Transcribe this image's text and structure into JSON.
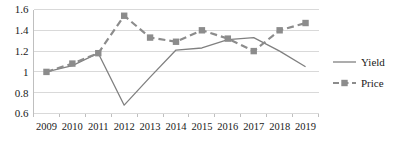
{
  "chart_data": {
    "type": "line",
    "title": "",
    "xlabel": "",
    "ylabel": "",
    "categories": [
      "2009",
      "2010",
      "2011",
      "2012",
      "2013",
      "2014",
      "2015",
      "2016",
      "2017",
      "2018",
      "2019"
    ],
    "series": [
      {
        "name": "Yield",
        "style": "solid",
        "marker": "none",
        "color": "#808080",
        "values": [
          1.0,
          1.06,
          1.18,
          0.68,
          0.95,
          1.21,
          1.23,
          1.31,
          1.33,
          1.2,
          1.05
        ]
      },
      {
        "name": "Price",
        "style": "dashed",
        "marker": "square",
        "color": "#8c8c8c",
        "values": [
          1.0,
          1.08,
          1.18,
          1.54,
          1.33,
          1.29,
          1.4,
          1.32,
          1.2,
          1.4,
          1.47
        ]
      }
    ],
    "ylim": [
      0.6,
      1.6
    ],
    "yticks": [
      "0.6",
      "0.8",
      "1",
      "1.2",
      "1.4",
      "1.6"
    ],
    "ytick_values": [
      0.6,
      0.8,
      1.0,
      1.2,
      1.4,
      1.6
    ],
    "grid": true,
    "grid_color": "#d9d9d9",
    "axis_color": "#bfbfbf",
    "legend_position": "right",
    "legend": [
      "Yield",
      "Price"
    ]
  }
}
